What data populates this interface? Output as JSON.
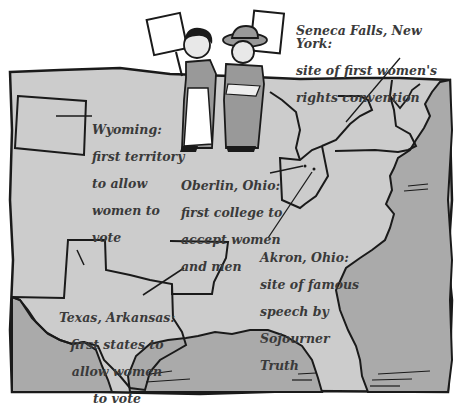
{
  "colors": {
    "land": "#cccccc",
    "water": "#a9a9a9",
    "outline": "#1a1a1a",
    "text": "#3a3a3a",
    "background": "#ffffff"
  },
  "labels": {
    "seneca": {
      "lines": [
        "Seneca Falls, New York:",
        "site of first women's",
        "rights convention"
      ]
    },
    "wyoming": {
      "lines": [
        "Wyoming:",
        "first territory",
        "to allow",
        "women to",
        "vote"
      ]
    },
    "oberlin": {
      "lines": [
        "Oberlin, Ohio:",
        "first college to",
        "accept women",
        "and men"
      ]
    },
    "akron": {
      "lines": [
        "Akron, Ohio:",
        "site of famous",
        "speech by",
        "Sojourner",
        "Truth"
      ]
    },
    "texas_arkansas": {
      "lines": [
        "Texas, Arkansas:",
        "first states to",
        "allow women",
        "to vote"
      ]
    }
  },
  "figures": [
    {
      "name": "suffragist-left",
      "sign": "blank placard"
    },
    {
      "name": "suffragist-right",
      "sign": "blank placard",
      "hat": "wide-brim hat"
    }
  ]
}
